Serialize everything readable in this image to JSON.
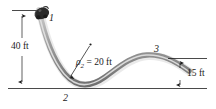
{
  "figure": {
    "type": "roller-coaster-track-diagram",
    "background_color": "#ffffff",
    "ink_color": "#1c1c1c",
    "track_color": "#9a9a9a",
    "car_color": "#2b2b2b",
    "labels": {
      "point_1": "1",
      "point_2": "2",
      "point_3": "3",
      "height_left": "40 ft",
      "height_right": "15 ft",
      "radius_symbol": "ρ",
      "radius_subscript": "2",
      "radius_equation": " = 20 ft",
      "radius_full": "ρ₂ = 20 ft"
    },
    "geometry": {
      "baseline_y_px": 88,
      "top_of_track_y_px": 10,
      "right_end_y_px": 70,
      "height_left_ft": 40,
      "height_right_ft": 15,
      "radius_ft": 20
    }
  }
}
